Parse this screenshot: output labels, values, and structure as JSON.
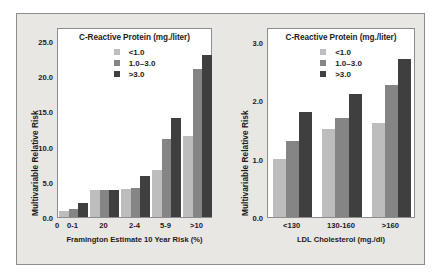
{
  "figure": {
    "background_color": "#e9e7e4",
    "frame_color": "#8d8d8d",
    "plot_background": "#ffffff"
  },
  "series_colors": {
    "low": "#bdbdbd",
    "mid": "#858585",
    "high": "#3f3f3f"
  },
  "legend": {
    "title": "C-Reactive Protein (mg./liter)",
    "items": [
      {
        "label": "<1.0",
        "color": "#bdbdbd"
      },
      {
        "label": "1.0–3.0",
        "color": "#858585"
      },
      {
        "label": ">3.0",
        "color": "#3f3f3f"
      }
    ]
  },
  "chart_data": [
    {
      "id": "framingham-risk-chart",
      "type": "bar",
      "title": "C-Reactive Protein (mg./liter)",
      "xlabel": "Framington Estimate 10 Year Risk (%)",
      "ylabel": "Multivariable Relative Risk",
      "categories": [
        "0-1",
        "20",
        "2-4",
        "5-9",
        ">10"
      ],
      "origin_tick_label": "0",
      "series": [
        {
          "name": "<1.0",
          "color": "#bdbdbd",
          "values": [
            0.9,
            3.8,
            4.0,
            6.7,
            11.5
          ]
        },
        {
          "name": "1.0–3.0",
          "color": "#858585",
          "values": [
            1.2,
            3.8,
            4.1,
            11.1,
            21.0
          ]
        },
        {
          "name": ">3.0",
          "color": "#3f3f3f",
          "values": [
            2.0,
            3.8,
            5.8,
            14.1,
            23.0
          ]
        }
      ],
      "ylim": [
        0,
        27.0
      ],
      "yticks": [
        "0.0",
        "5.0",
        "10.0",
        "15.0",
        "20.0",
        "25.0"
      ],
      "ytick_values": [
        0.0,
        5.0,
        10.0,
        15.0,
        20.0,
        25.0
      ],
      "grid": false,
      "legend_position": "inside-top-center"
    },
    {
      "id": "ldl-cholesterol-chart",
      "type": "bar",
      "title": "C-Reactive Protein (mg./liter)",
      "xlabel": "LDL Cholesterol (mg./dl)",
      "ylabel": "Multivariable Relative Risk",
      "categories": [
        "<130",
        "130-160",
        ">160"
      ],
      "series": [
        {
          "name": "<1.0",
          "color": "#bdbdbd",
          "values": [
            1.0,
            1.5,
            1.6
          ]
        },
        {
          "name": "1.0–3.0",
          "color": "#858585",
          "values": [
            1.3,
            1.7,
            2.25
          ]
        },
        {
          "name": ">3.0",
          "color": "#3f3f3f",
          "values": [
            1.8,
            2.1,
            2.7
          ]
        }
      ],
      "ylim": [
        0,
        3.25
      ],
      "yticks": [
        "0.0",
        "1.0",
        "2.0",
        "3.0"
      ],
      "ytick_values": [
        0.0,
        1.0,
        2.0,
        3.0
      ],
      "grid": false,
      "legend_position": "inside-top-center"
    }
  ]
}
